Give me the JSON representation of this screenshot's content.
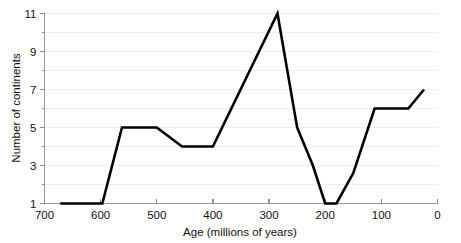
{
  "chart_data": {
    "type": "line",
    "title": "",
    "xlabel": "Age (millions of years)",
    "ylabel": "Number of continents",
    "xlim": [
      700,
      0
    ],
    "ylim": [
      1,
      11
    ],
    "x_reversed": true,
    "grid": "horizontal",
    "legend": "none",
    "x_ticks": [
      700,
      600,
      500,
      400,
      300,
      200,
      100,
      0
    ],
    "x_tick_labels": [
      "700",
      "600",
      "500",
      "400",
      "300",
      "200",
      "100",
      "0"
    ],
    "y_ticks": [
      1,
      3,
      5,
      7,
      9,
      11
    ],
    "y_tick_labels": [
      "1",
      "3",
      "5",
      "7",
      "9",
      "11"
    ],
    "y_minor_ticks": [
      2,
      4,
      6,
      8,
      10
    ],
    "series": [
      {
        "name": "Number of continents",
        "color": "#000000",
        "x": [
          672,
          597,
          562,
          500,
          455,
          400,
          285,
          250,
          222,
          200,
          180,
          150,
          112,
          52,
          24
        ],
        "y": [
          1,
          1,
          5,
          5,
          4,
          4,
          11,
          5,
          3,
          1,
          1,
          2.6,
          6,
          6,
          7
        ]
      }
    ],
    "points": [
      {
        "age": 672,
        "continents": 1
      },
      {
        "age": 597,
        "continents": 1
      },
      {
        "age": 562,
        "continents": 5
      },
      {
        "age": 500,
        "continents": 5
      },
      {
        "age": 455,
        "continents": 4
      },
      {
        "age": 400,
        "continents": 4
      },
      {
        "age": 285,
        "continents": 11
      },
      {
        "age": 250,
        "continents": 5
      },
      {
        "age": 222,
        "continents": 3
      },
      {
        "age": 200,
        "continents": 1
      },
      {
        "age": 180,
        "continents": 1
      },
      {
        "age": 150,
        "continents": 2.6
      },
      {
        "age": 112,
        "continents": 6
      },
      {
        "age": 52,
        "continents": 6
      },
      {
        "age": 24,
        "continents": 7
      }
    ]
  }
}
